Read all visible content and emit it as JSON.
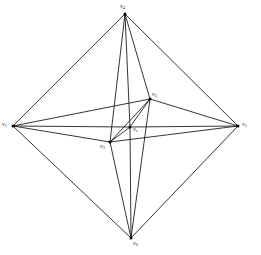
{
  "figure": {
    "background_color": "#ffffff",
    "edge_color": "#111111",
    "vertex_color": "#000000",
    "label_color": "#1a1a1a",
    "canvas": {
      "width": 261,
      "height": 255
    }
  },
  "graph": {
    "type": "complete-graph",
    "vertex_count": 6,
    "edge_count": 15,
    "vertices": [
      {
        "id": "v0",
        "symbol": "v",
        "subscript": "0",
        "label": "v0",
        "x": 131,
        "y": 238,
        "label_x": 133,
        "label_y": 240,
        "role": "outer-bottom"
      },
      {
        "id": "v1",
        "symbol": "v",
        "subscript": "1",
        "label": "v1",
        "x": 13,
        "y": 126,
        "label_x": 2,
        "label_y": 121,
        "role": "outer-left"
      },
      {
        "id": "v2",
        "symbol": "v",
        "subscript": "2",
        "label": "v2",
        "x": 150,
        "y": 99,
        "label_x": 152,
        "label_y": 91,
        "role": "inner-upper-right"
      },
      {
        "id": "v3",
        "symbol": "v",
        "subscript": "3",
        "label": "v3",
        "x": 110,
        "y": 142,
        "label_x": 100,
        "label_y": 143,
        "role": "inner-lower-left"
      },
      {
        "id": "v4",
        "symbol": "v",
        "subscript": "4",
        "label": "v4",
        "x": 125,
        "y": 14,
        "label_x": 120,
        "label_y": 3,
        "role": "outer-top"
      },
      {
        "id": "v5",
        "symbol": "v",
        "subscript": "5",
        "label": "v5",
        "x": 238,
        "y": 126,
        "label_x": 242,
        "label_y": 121,
        "role": "outer-right"
      },
      {
        "id": "vc",
        "symbol": "v",
        "subscript": "c",
        "label": "vc",
        "x": 130,
        "y": 127,
        "label_x": 133,
        "label_y": 126,
        "role": "inner-center"
      }
    ],
    "edges": [
      {
        "from": "v4",
        "to": "v1",
        "name": "edge-v4-v1"
      },
      {
        "from": "v4",
        "to": "v5",
        "name": "edge-v4-v5"
      },
      {
        "from": "v0",
        "to": "v1",
        "name": "edge-v0-v1"
      },
      {
        "from": "v0",
        "to": "v5",
        "name": "edge-v0-v5"
      },
      {
        "from": "v1",
        "to": "v2",
        "name": "edge-v1-v2"
      },
      {
        "from": "v1",
        "to": "vc",
        "name": "edge-v1-vc"
      },
      {
        "from": "v1",
        "to": "v3",
        "name": "edge-v1-v3"
      },
      {
        "from": "v5",
        "to": "v2",
        "name": "edge-v5-v2"
      },
      {
        "from": "v5",
        "to": "vc",
        "name": "edge-v5-vc"
      },
      {
        "from": "v5",
        "to": "v3",
        "name": "edge-v5-v3"
      },
      {
        "from": "v4",
        "to": "v2",
        "name": "edge-v4-v2"
      },
      {
        "from": "v4",
        "to": "vc",
        "name": "edge-v4-vc"
      },
      {
        "from": "v4",
        "to": "v3",
        "name": "edge-v4-v3"
      },
      {
        "from": "v0",
        "to": "v2",
        "name": "edge-v0-v2"
      },
      {
        "from": "v0",
        "to": "vc",
        "name": "edge-v0-vc"
      },
      {
        "from": "v0",
        "to": "v3",
        "name": "edge-v0-v3"
      },
      {
        "from": "v2",
        "to": "vc",
        "name": "edge-v2-vc"
      },
      {
        "from": "v2",
        "to": "v3",
        "name": "edge-v2-v3"
      },
      {
        "from": "vc",
        "to": "v3",
        "name": "edge-vc-v3"
      }
    ]
  }
}
